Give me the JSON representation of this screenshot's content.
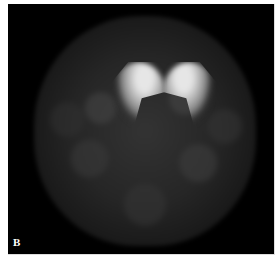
{
  "figure": {
    "panel_label": "B"
  }
}
